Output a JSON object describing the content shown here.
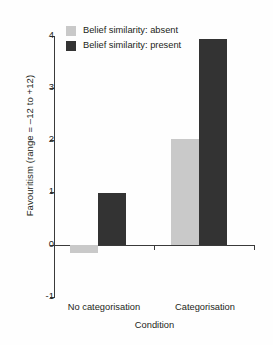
{
  "chart_data": {
    "type": "bar",
    "title": "",
    "xlabel": "Condition",
    "ylabel": "Favouritism (range = –12 to +12)",
    "categories": [
      "No categorisation",
      "Categorisation"
    ],
    "series": [
      {
        "name": "Belief similarity: absent",
        "values": [
          -0.15,
          2.02
        ],
        "color": "#c9c9c9"
      },
      {
        "name": "Belief similarity: present",
        "values": [
          1.0,
          3.95
        ],
        "color": "#333333"
      }
    ],
    "ylim": [
      -1,
      4
    ],
    "yticks": [
      4,
      3,
      2,
      1,
      0,
      -1
    ],
    "ytick_labels": [
      "4",
      "3",
      "2",
      "1",
      "0",
      "-1"
    ],
    "grid": false,
    "legend_position": "top-left"
  },
  "legend": {
    "items": [
      {
        "label": "Belief similarity: absent",
        "swatch": "absent"
      },
      {
        "label": "Belief similarity: present",
        "swatch": "present"
      }
    ]
  },
  "axes": {
    "y_title": "Favouritism (range = –12 to +12)",
    "x_title": "Condition"
  }
}
